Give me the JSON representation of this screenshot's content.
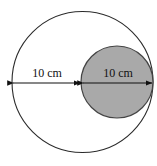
{
  "figure": {
    "type": "geometry-diagram",
    "background_color": "#ffffff",
    "shapes": [
      {
        "name": "large-circle",
        "kind": "circle",
        "center": {
          "x": 82.5,
          "y": 82
        },
        "radius": 70.5,
        "fill": "none",
        "fill_color": "#ffffff",
        "stroke_color": "#2b2b2b",
        "stroke_width": 1.1
      },
      {
        "name": "small-circle",
        "kind": "circle",
        "center": {
          "x": 117,
          "y": 82
        },
        "radius": 36,
        "fill": "solid",
        "fill_color": "#a9a9a9",
        "stroke_color": "#444444",
        "stroke_width": 1.2
      }
    ],
    "dimensions": [
      {
        "name": "left-dimension",
        "label": "10 cm",
        "value": 10,
        "unit": "cm",
        "measures": "radius of the large circle",
        "arrow_y": 83,
        "x_start": 13,
        "x_end": 80,
        "label_x": 47,
        "label_y": 77,
        "arrowheads": "both",
        "color": "#111111"
      },
      {
        "name": "right-dimension",
        "label": "10 cm",
        "value": 10,
        "unit": "cm",
        "measures": "diameter of the small shaded circle",
        "arrow_y": 83,
        "x_start": 83,
        "x_end": 152,
        "label_x": 118,
        "label_y": 77,
        "arrowheads": "both",
        "color": "#111111"
      }
    ]
  },
  "colors": {
    "shaded_fill": "#a9a9a9",
    "outline": "#2b2b2b",
    "small_outline": "#444444",
    "text": "#111111",
    "background": "#ffffff"
  }
}
